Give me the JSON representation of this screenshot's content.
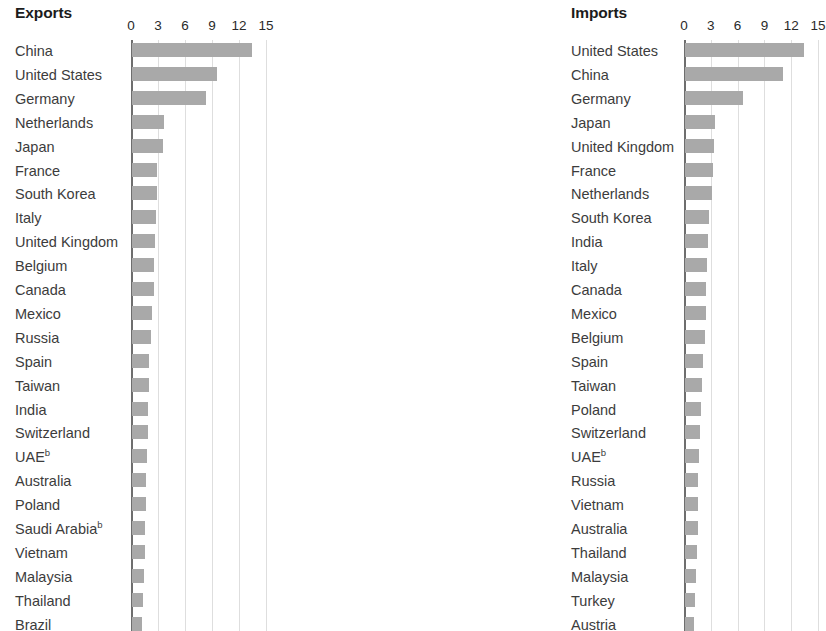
{
  "chart_data": {
    "type": "bar",
    "orientation": "horizontal",
    "panels": [
      {
        "title": "Exports",
        "xlabel": "",
        "ylabel": "",
        "xlim": [
          0,
          15
        ],
        "xticks": [
          0,
          3,
          6,
          9,
          12,
          15
        ],
        "grid": true,
        "legend": "none",
        "categories": [
          "China",
          "United States",
          "Germany",
          "Netherlands",
          "Japan",
          "France",
          "South Korea",
          "Italy",
          "United Kingdom",
          "Belgium",
          "Canada",
          "Mexico",
          "Russia",
          "Spain",
          "Taiwan",
          "India",
          "Switzerland",
          "UAE",
          "Australia",
          "Poland",
          "Saudi Arabia",
          "Vietnam",
          "Malaysia",
          "Thailand",
          "Brazil"
        ],
        "footnotes": {
          "UAE": "b",
          "Saudi Arabia": "b"
        },
        "values": [
          13.3,
          9.4,
          8.2,
          3.5,
          3.4,
          2.8,
          2.8,
          2.7,
          2.5,
          2.4,
          2.4,
          2.2,
          2.1,
          1.9,
          1.9,
          1.8,
          1.8,
          1.7,
          1.5,
          1.5,
          1.4,
          1.4,
          1.3,
          1.2,
          1.1
        ]
      },
      {
        "title": "Imports",
        "xlabel": "",
        "ylabel": "",
        "xlim": [
          0,
          15
        ],
        "xticks": [
          0,
          3,
          6,
          9,
          12,
          15
        ],
        "grid": true,
        "legend": "none",
        "categories": [
          "United States",
          "China",
          "Germany",
          "Japan",
          "United Kingdom",
          "France",
          "Netherlands",
          "South Korea",
          "India",
          "Italy",
          "Canada",
          "Mexico",
          "Belgium",
          "Spain",
          "Taiwan",
          "Poland",
          "Switzerland",
          "UAE",
          "Russia",
          "Vietnam",
          "Australia",
          "Thailand",
          "Malaysia",
          "Turkey",
          "Austria"
        ],
        "footnotes": {
          "UAE": "b"
        },
        "values": [
          13.3,
          11.0,
          6.5,
          3.4,
          3.2,
          3.1,
          3.0,
          2.7,
          2.6,
          2.5,
          2.4,
          2.3,
          2.2,
          2.0,
          1.9,
          1.8,
          1.7,
          1.6,
          1.5,
          1.5,
          1.4,
          1.3,
          1.2,
          1.1,
          1.0
        ]
      }
    ]
  },
  "colors": {
    "bar": "#a9a9a9",
    "gridline": "#dedede",
    "axis": "#6e6e6e",
    "title_text": "#1c1c1c",
    "label_text": "#3c3c3c"
  }
}
